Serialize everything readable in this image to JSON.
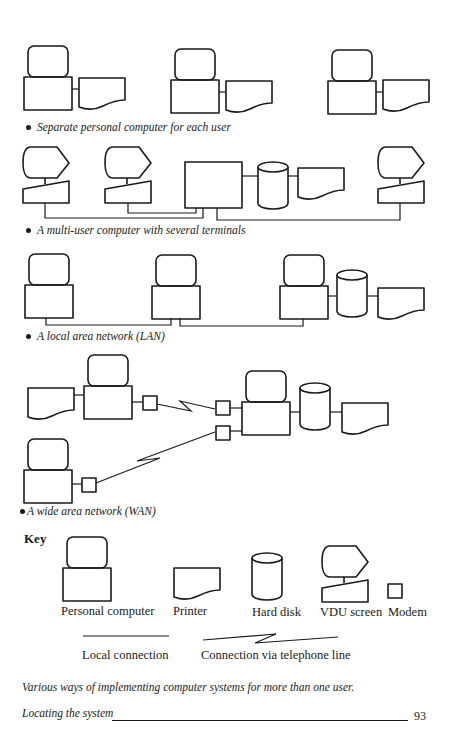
{
  "sections": [
    {
      "id": "separate",
      "caption": "Separate personal computer for each user"
    },
    {
      "id": "multiuser",
      "caption": "A multi-user computer with several terminals"
    },
    {
      "id": "lan",
      "caption": "A local area network (LAN)"
    },
    {
      "id": "wan",
      "caption": "A wide area network (WAN)"
    }
  ],
  "key": {
    "title": "Key",
    "items": [
      {
        "symbol": "personal-computer",
        "label": "Personal computer"
      },
      {
        "symbol": "printer",
        "label": "Printer"
      },
      {
        "symbol": "hard-disk",
        "label": "Hard disk"
      },
      {
        "symbol": "vdu-screen",
        "label": "VDU screen"
      },
      {
        "symbol": "modem",
        "label": "Modem"
      }
    ],
    "connections": [
      {
        "symbol": "local-connection-line",
        "label": "Local connection"
      },
      {
        "symbol": "telephone-connection-line",
        "label": "Connection via telephone line"
      }
    ]
  },
  "figure_caption": "Various ways of implementing computer systems for more than one user.",
  "footer": {
    "running_title": "Locating the system",
    "page_number": "93"
  }
}
